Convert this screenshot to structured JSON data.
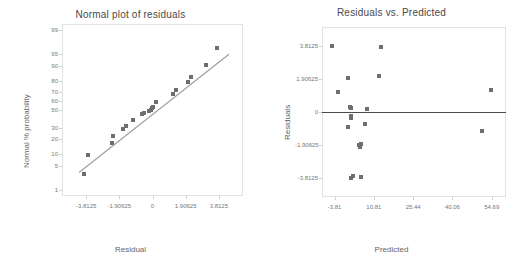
{
  "chart_data": [
    {
      "type": "scatter",
      "title": "Normal plot of residuals",
      "xlabel": "Residual",
      "ylabel": "Normal % probability",
      "grid": false,
      "legend": "none",
      "xlim": [
        -5.2,
        5.2
      ],
      "xticks": [
        "-3.8125",
        "-1.90625",
        "0",
        "1.90625",
        "3.8125"
      ],
      "xtick_values": [
        -3.8125,
        -1.90625,
        0,
        1.90625,
        3.8125
      ],
      "yscale": "normal-probability",
      "yticks": [
        "1",
        "5",
        "10",
        "20",
        "30",
        "50",
        "60",
        "70",
        "80",
        "90",
        "95",
        "99"
      ],
      "ytick_values": [
        1,
        5,
        10,
        20,
        30,
        50,
        60,
        70,
        80,
        90,
        95,
        99
      ],
      "x": [
        -3.95,
        -3.7,
        -2.3,
        -2.25,
        -1.7,
        -1.55,
        -1.1,
        -0.62,
        -0.5,
        -0.18,
        -0.1,
        -0.05,
        0.05,
        0.22,
        1.2,
        1.35,
        2.05,
        2.2,
        3.05,
        3.7
      ],
      "y": [
        3.0,
        9.5,
        17.0,
        22.0,
        28.5,
        32.0,
        38.5,
        45.0,
        47.0,
        49.0,
        50.5,
        52.0,
        54.0,
        59.0,
        68.0,
        72.0,
        79.0,
        83.0,
        90.5,
        96.5
      ],
      "reference_line": {
        "label": "normal reference line",
        "from": [
          -4.25,
          3.6
        ],
        "to": [
          4.35,
          95.0
        ]
      }
    },
    {
      "type": "scatter",
      "title": "Residuals vs. Predicted",
      "xlabel": "Predicted",
      "ylabel": "Residuals",
      "grid": false,
      "legend": "none",
      "xlim": [
        -8.5,
        60.0
      ],
      "xticks": [
        "-3.81",
        "10.81",
        "25.44",
        "40.06",
        "54.69"
      ],
      "xtick_values": [
        -3.81,
        10.81,
        25.44,
        40.06,
        54.69
      ],
      "ylim": [
        -4.9,
        4.9
      ],
      "yticks": [
        "3.8125",
        "1.90625",
        "0",
        "-1.90625",
        "-3.8125"
      ],
      "ytick_values": [
        3.8125,
        1.90625,
        0,
        -1.90625,
        -3.8125
      ],
      "x": [
        -4.6,
        -2.6,
        1.3,
        1.3,
        2.0,
        2.2,
        2.3,
        2.3,
        2.4,
        3.1,
        5.4,
        5.6,
        5.9,
        6.2,
        7.4,
        8.2,
        12.6,
        13.6,
        50.9,
        54.6
      ],
      "y": [
        3.8,
        1.18,
        1.95,
        -0.88,
        0.28,
        0.22,
        -0.22,
        -0.32,
        -3.78,
        -3.7,
        -1.93,
        -2.02,
        -1.85,
        -3.72,
        -0.72,
        0.2,
        2.05,
        3.72,
        -1.12,
        1.28
      ],
      "reference_line": {
        "label": "zero line",
        "y": 0
      }
    }
  ],
  "left_chart": {
    "title": "Normal plot of residuals",
    "xlabel": "Residual",
    "ylabel": "Normal % probability"
  },
  "right_chart": {
    "title": "Residuals vs. Predicted",
    "xlabel": "Predicted",
    "ylabel": "Residuals"
  },
  "colors": {
    "marker": "#6e6e6e",
    "reference_line": "#9a9a9a",
    "zero_line": "#4a4a4a",
    "frame": "#e2e2e2",
    "text": "#555555",
    "background": "#ffffff"
  }
}
